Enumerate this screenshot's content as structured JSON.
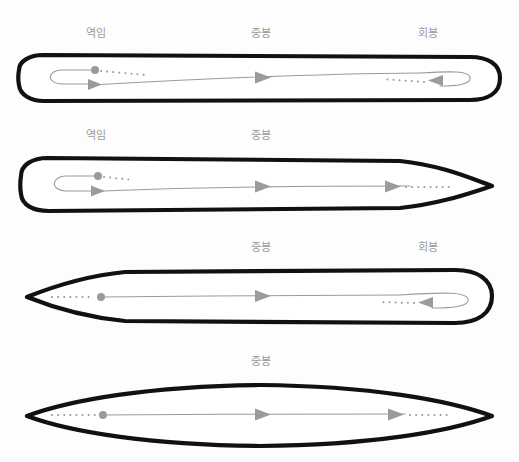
{
  "page": {
    "background_color": "#fdfdfd"
  },
  "colors": {
    "outline": "#111111",
    "guide_gray": "#9b9b9b",
    "label_gray": "#9a9a9a",
    "shape_fill": "#ffffff"
  },
  "labels": {
    "yeogim": "역임",
    "jungbong": "중봉",
    "hoebong": "회봉"
  },
  "diagrams": [
    {
      "index": 1,
      "name": "stroke-blunt-start-blunt-end",
      "left_end": "rounded",
      "right_end": "rounded",
      "labels": [
        {
          "text": "역임",
          "x": 96
        },
        {
          "text": "중봉",
          "x": 261
        },
        {
          "text": "회봉",
          "x": 428
        }
      ]
    },
    {
      "index": 2,
      "name": "stroke-blunt-start-pointed-end",
      "left_end": "rounded",
      "right_end": "pointed",
      "labels": [
        {
          "text": "역임",
          "x": 96
        },
        {
          "text": "중봉",
          "x": 261
        }
      ]
    },
    {
      "index": 3,
      "name": "stroke-pointed-start-blunt-end",
      "left_end": "pointed",
      "right_end": "rounded",
      "labels": [
        {
          "text": "중봉",
          "x": 261
        },
        {
          "text": "회봉",
          "x": 428
        }
      ]
    },
    {
      "index": 4,
      "name": "stroke-pointed-start-pointed-end",
      "left_end": "pointed",
      "right_end": "pointed",
      "labels": [
        {
          "text": "중봉",
          "x": 261
        }
      ]
    }
  ]
}
